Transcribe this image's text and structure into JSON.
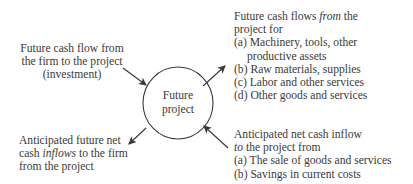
{
  "center": {
    "line1": "Future",
    "line2": "project"
  },
  "top_left": {
    "lines": [
      "Future cash flow from",
      "the firm to the project",
      "(investment)"
    ]
  },
  "top_right": {
    "line1_pre": "Future cash flows ",
    "line1_em": "from",
    "line1_post": " the",
    "line2": "project for",
    "items": [
      "(a) Machinery, tools, other",
      "productive assets",
      "(b) Raw materials, supplies",
      "(c) Labor and other services",
      "(d) Other goods and services"
    ]
  },
  "bottom_left": {
    "line1": "Anticipated future net",
    "line2_pre": "cash ",
    "line2_em": "inflows",
    "line2_post": " to the firm",
    "line3": "from the project"
  },
  "bottom_right": {
    "line1": "Anticipated net cash inflow",
    "line2_em": "to",
    "line2_post": " the project from",
    "items": [
      "(a) The sale of goods and services",
      "(b) Savings in current costs"
    ]
  },
  "colors": {
    "stroke": "#3a3a3a",
    "text": "#3a3a3a",
    "background": "#ffffff"
  }
}
